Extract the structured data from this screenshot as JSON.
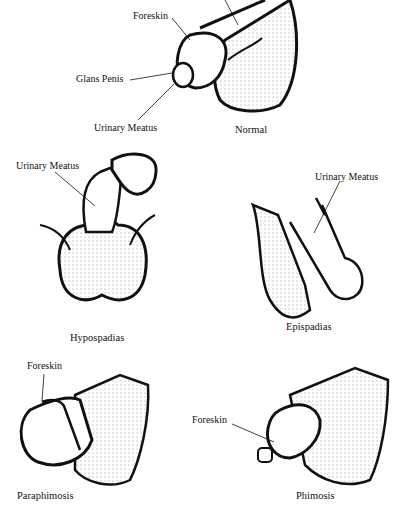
{
  "panels": {
    "normal": {
      "caption": "Normal",
      "labels": {
        "foreskin": "Foreskin",
        "glans": "Glans Penis",
        "meatus": "Urinary Meatus"
      }
    },
    "hypospadias": {
      "caption": "Hypospadias",
      "labels": {
        "meatus": "Urinary Meatus"
      }
    },
    "epispadias": {
      "caption": "Epispadias",
      "labels": {
        "meatus": "Urinary Meatus"
      }
    },
    "paraphimosis": {
      "caption": "Paraphimosis",
      "labels": {
        "foreskin": "Foreskin"
      }
    },
    "phimosis": {
      "caption": "Phimosis",
      "labels": {
        "foreskin": "Foreskin"
      }
    }
  }
}
